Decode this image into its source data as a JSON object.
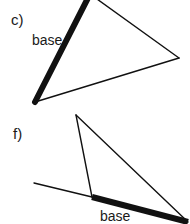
{
  "page": {
    "background_color": "#ffffff",
    "stroke_color": "#111111",
    "width": 190,
    "height": 224
  },
  "figures": [
    {
      "id": "figure-c",
      "part_label": "c)",
      "base_label": "base",
      "shape": "triangle",
      "vertices": [
        {
          "name": "apex-top",
          "x": 90,
          "y": -6
        },
        {
          "name": "vertex-bottom-left",
          "x": 35,
          "y": 102
        },
        {
          "name": "vertex-right",
          "x": 179,
          "y": 58
        }
      ],
      "edges": [
        {
          "name": "base-edge",
          "from": "vertex-bottom-left",
          "to": "apex-top",
          "weight": "thick",
          "width": 6
        },
        {
          "name": "right-edge",
          "from": "apex-top",
          "to": "vertex-right",
          "weight": "thin",
          "width": 1.4
        },
        {
          "name": "bottom-edge",
          "from": "vertex-right",
          "to": "vertex-bottom-left",
          "weight": "thin",
          "width": 1.4
        }
      ]
    },
    {
      "id": "figure-f",
      "part_label": "f)",
      "base_label": "base",
      "shape": "triangle",
      "vertices": [
        {
          "name": "apex-top",
          "x": 76,
          "y": 115
        },
        {
          "name": "vertex-bottom-left",
          "x": 92,
          "y": 197
        },
        {
          "name": "vertex-bottom-right",
          "x": 188,
          "y": 222
        }
      ],
      "edges": [
        {
          "name": "base-edge",
          "from": "vertex-bottom-left",
          "to": "vertex-bottom-right",
          "weight": "thick",
          "width": 6
        },
        {
          "name": "left-edge",
          "from": "apex-top",
          "to": "vertex-bottom-left",
          "weight": "thin",
          "width": 1.4
        },
        {
          "name": "right-edge",
          "from": "apex-top",
          "to": "vertex-bottom-right",
          "weight": "thin",
          "width": 1.4
        }
      ],
      "extension_line": {
        "name": "base-extension",
        "from": {
          "x": 34,
          "y": 183
        },
        "to": {
          "x": 92,
          "y": 197
        },
        "weight": "thin",
        "width": 1.4
      }
    }
  ]
}
